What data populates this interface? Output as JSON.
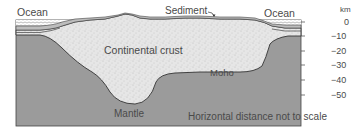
{
  "diagram": {
    "labels": {
      "ocean_left": "Ocean",
      "ocean_right": "Ocean",
      "sediment": "Sediment",
      "continental_crust": "Continental crust",
      "moho": "Moho",
      "mantle": "Mantle",
      "scale_note": "Horizontal distance not to scale"
    },
    "depth_axis": {
      "unit": "km",
      "ticks": [
        "0",
        "−10",
        "−20",
        "−30",
        "−40",
        "−50"
      ]
    },
    "colors": {
      "mantle": "#9b9b9b",
      "crust": "#e4e4e4",
      "sediment": "#bdbdbd",
      "outline": "#333333",
      "text": "#4a4a4a"
    }
  }
}
